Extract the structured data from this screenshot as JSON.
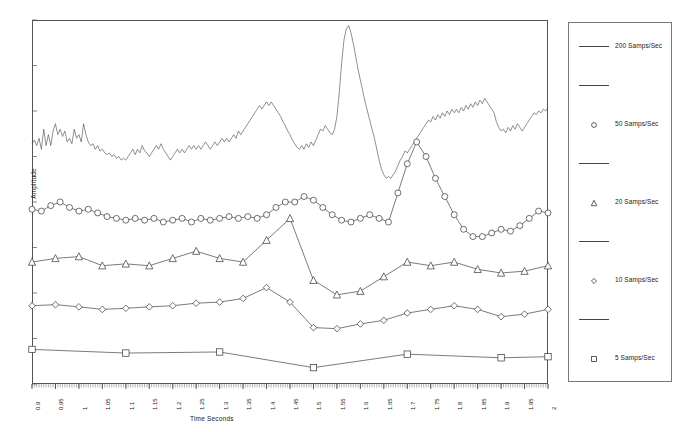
{
  "chart_data": {
    "type": "line",
    "title": "",
    "xlabel": "Time Seconds",
    "ylabel": "Amplitude",
    "xlim": [
      0.9,
      2.0
    ],
    "xtick_step": 0.05,
    "grid": false,
    "legend_position": "right-outside",
    "note": "Five acquisitions of the same transient waveform at different sampling rates, drawn with vertical offsets so the traces do not overlap. Y axis is uncalibrated amplitude (no numeric tick labels).",
    "xticklabels": [
      "0.9",
      "0.95",
      "1",
      "1.05",
      "1.1",
      "1.15",
      "1.2",
      "1.25",
      "1.3",
      "1.35",
      "1.4",
      "1.45",
      "1.5",
      "1.55",
      "1.6",
      "1.65",
      "1.7",
      "1.75",
      "1.8",
      "1.85",
      "1.9",
      "1.95",
      "2"
    ],
    "series": [
      {
        "name": "200 Samps/Sec",
        "marker": "none",
        "color": "#444444",
        "x": [
          0.9,
          0.905,
          0.91,
          0.915,
          0.92,
          0.925,
          0.93,
          0.935,
          0.94,
          0.945,
          0.95,
          0.955,
          0.96,
          0.965,
          0.97,
          0.975,
          0.98,
          0.985,
          0.99,
          0.995,
          1.0,
          1.005,
          1.01,
          1.015,
          1.02,
          1.025,
          1.03,
          1.035,
          1.04,
          1.045,
          1.05,
          1.055,
          1.06,
          1.065,
          1.07,
          1.075,
          1.08,
          1.085,
          1.09,
          1.095,
          1.1,
          1.105,
          1.11,
          1.115,
          1.12,
          1.125,
          1.13,
          1.135,
          1.14,
          1.145,
          1.15,
          1.155,
          1.16,
          1.165,
          1.17,
          1.175,
          1.18,
          1.185,
          1.19,
          1.195,
          1.2,
          1.205,
          1.21,
          1.215,
          1.22,
          1.225,
          1.23,
          1.235,
          1.24,
          1.245,
          1.25,
          1.255,
          1.26,
          1.265,
          1.27,
          1.275,
          1.28,
          1.285,
          1.29,
          1.295,
          1.3,
          1.305,
          1.31,
          1.315,
          1.32,
          1.325,
          1.33,
          1.335,
          1.34,
          1.345,
          1.35,
          1.355,
          1.36,
          1.365,
          1.37,
          1.375,
          1.38,
          1.385,
          1.39,
          1.395,
          1.4,
          1.405,
          1.41,
          1.415,
          1.42,
          1.425,
          1.43,
          1.435,
          1.44,
          1.445,
          1.45,
          1.455,
          1.46,
          1.465,
          1.47,
          1.475,
          1.48,
          1.485,
          1.49,
          1.495,
          1.5,
          1.505,
          1.51,
          1.515,
          1.52,
          1.525,
          1.53,
          1.535,
          1.54,
          1.545,
          1.55,
          1.555,
          1.56,
          1.565,
          1.57,
          1.575,
          1.58,
          1.585,
          1.59,
          1.595,
          1.6,
          1.605,
          1.61,
          1.615,
          1.62,
          1.625,
          1.63,
          1.635,
          1.64,
          1.645,
          1.65,
          1.655,
          1.66,
          1.665,
          1.67,
          1.675,
          1.68,
          1.685,
          1.69,
          1.695,
          1.7,
          1.705,
          1.71,
          1.715,
          1.72,
          1.725,
          1.73,
          1.735,
          1.74,
          1.745,
          1.75,
          1.755,
          1.76,
          1.765,
          1.77,
          1.775,
          1.78,
          1.785,
          1.79,
          1.795,
          1.8,
          1.805,
          1.81,
          1.815,
          1.82,
          1.825,
          1.83,
          1.835,
          1.84,
          1.845,
          1.85,
          1.855,
          1.86,
          1.865,
          1.87,
          1.875,
          1.88,
          1.885,
          1.89,
          1.895,
          1.9,
          1.905,
          1.91,
          1.915,
          1.92,
          1.925,
          1.93,
          1.935,
          1.94,
          1.945,
          1.95,
          1.955,
          1.96,
          1.965,
          1.97,
          1.975,
          1.98,
          1.985,
          1.99,
          1.995,
          2.0
        ],
        "y": [
          0.66,
          0.67,
          0.655,
          0.675,
          0.645,
          0.7,
          0.655,
          0.685,
          0.655,
          0.695,
          0.715,
          0.685,
          0.7,
          0.68,
          0.695,
          0.665,
          0.675,
          0.66,
          0.7,
          0.675,
          0.685,
          0.665,
          0.715,
          0.685,
          0.665,
          0.655,
          0.66,
          0.645,
          0.655,
          0.64,
          0.645,
          0.635,
          0.63,
          0.635,
          0.625,
          0.63,
          0.62,
          0.625,
          0.615,
          0.62,
          0.615,
          0.625,
          0.635,
          0.645,
          0.63,
          0.645,
          0.635,
          0.655,
          0.64,
          0.635,
          0.625,
          0.635,
          0.645,
          0.655,
          0.645,
          0.66,
          0.645,
          0.635,
          0.625,
          0.615,
          0.625,
          0.635,
          0.645,
          0.635,
          0.645,
          0.635,
          0.645,
          0.655,
          0.645,
          0.655,
          0.645,
          0.655,
          0.645,
          0.655,
          0.665,
          0.655,
          0.645,
          0.655,
          0.665,
          0.655,
          0.665,
          0.675,
          0.665,
          0.675,
          0.665,
          0.675,
          0.685,
          0.675,
          0.695,
          0.685,
          0.695,
          0.705,
          0.715,
          0.725,
          0.735,
          0.745,
          0.755,
          0.765,
          0.755,
          0.765,
          0.775,
          0.765,
          0.775,
          0.765,
          0.755,
          0.745,
          0.735,
          0.72,
          0.71,
          0.695,
          0.685,
          0.67,
          0.66,
          0.65,
          0.645,
          0.655,
          0.645,
          0.66,
          0.65,
          0.665,
          0.655,
          0.67,
          0.685,
          0.7,
          0.695,
          0.71,
          0.7,
          0.69,
          0.685,
          0.7,
          0.735,
          0.8,
          0.88,
          0.945,
          0.975,
          0.985,
          0.965,
          0.935,
          0.9,
          0.865,
          0.835,
          0.805,
          0.775,
          0.75,
          0.725,
          0.7,
          0.675,
          0.645,
          0.615,
          0.59,
          0.575,
          0.565,
          0.57,
          0.565,
          0.575,
          0.585,
          0.6,
          0.615,
          0.625,
          0.64,
          0.635,
          0.645,
          0.655,
          0.665,
          0.675,
          0.685,
          0.695,
          0.705,
          0.715,
          0.725,
          0.72,
          0.735,
          0.725,
          0.74,
          0.73,
          0.745,
          0.735,
          0.75,
          0.74,
          0.755,
          0.745,
          0.755,
          0.745,
          0.76,
          0.75,
          0.765,
          0.755,
          0.77,
          0.76,
          0.775,
          0.765,
          0.78,
          0.77,
          0.785,
          0.775,
          0.765,
          0.755,
          0.745,
          0.72,
          0.705,
          0.695,
          0.7,
          0.69,
          0.705,
          0.695,
          0.71,
          0.7,
          0.715,
          0.705,
          0.695,
          0.705,
          0.715,
          0.725,
          0.735,
          0.745,
          0.74,
          0.75,
          0.745,
          0.755,
          0.75,
          0.76
        ]
      },
      {
        "name": "50 Samps/Sec",
        "marker": "circle",
        "color": "#333333",
        "x": [
          0.9,
          0.92,
          0.94,
          0.96,
          0.98,
          1.0,
          1.02,
          1.04,
          1.06,
          1.08,
          1.1,
          1.12,
          1.14,
          1.16,
          1.18,
          1.2,
          1.22,
          1.24,
          1.26,
          1.28,
          1.3,
          1.32,
          1.34,
          1.36,
          1.38,
          1.4,
          1.42,
          1.44,
          1.46,
          1.48,
          1.5,
          1.52,
          1.54,
          1.56,
          1.58,
          1.6,
          1.62,
          1.64,
          1.66,
          1.68,
          1.7,
          1.72,
          1.74,
          1.76,
          1.78,
          1.8,
          1.82,
          1.84,
          1.86,
          1.88,
          1.9,
          1.92,
          1.94,
          1.96,
          1.98,
          2.0
        ],
        "y": [
          0.48,
          0.475,
          0.49,
          0.5,
          0.485,
          0.475,
          0.48,
          0.47,
          0.46,
          0.455,
          0.45,
          0.455,
          0.45,
          0.455,
          0.445,
          0.45,
          0.455,
          0.445,
          0.455,
          0.45,
          0.455,
          0.46,
          0.455,
          0.46,
          0.455,
          0.465,
          0.485,
          0.5,
          0.5,
          0.515,
          0.505,
          0.485,
          0.465,
          0.45,
          0.445,
          0.455,
          0.465,
          0.455,
          0.445,
          0.525,
          0.605,
          0.665,
          0.625,
          0.565,
          0.515,
          0.465,
          0.425,
          0.405,
          0.405,
          0.415,
          0.425,
          0.42,
          0.435,
          0.455,
          0.475,
          0.47
        ]
      },
      {
        "name": "20 Samps/Sec",
        "marker": "triangle",
        "color": "#333333",
        "x": [
          0.9,
          0.95,
          1.0,
          1.05,
          1.1,
          1.15,
          1.2,
          1.25,
          1.3,
          1.35,
          1.4,
          1.45,
          1.5,
          1.55,
          1.6,
          1.65,
          1.7,
          1.75,
          1.8,
          1.85,
          1.9,
          1.95,
          2.0
        ],
        "y": [
          0.335,
          0.345,
          0.35,
          0.325,
          0.33,
          0.325,
          0.345,
          0.365,
          0.345,
          0.335,
          0.395,
          0.455,
          0.285,
          0.245,
          0.255,
          0.295,
          0.335,
          0.325,
          0.335,
          0.315,
          0.305,
          0.31,
          0.325
        ]
      },
      {
        "name": "10 Samps/Sec",
        "marker": "diamond",
        "color": "#333333",
        "x": [
          0.9,
          0.95,
          1.0,
          1.05,
          1.1,
          1.15,
          1.2,
          1.25,
          1.3,
          1.35,
          1.4,
          1.45,
          1.5,
          1.55,
          1.6,
          1.65,
          1.7,
          1.75,
          1.8,
          1.85,
          1.9,
          1.95,
          2.0
        ],
        "y": [
          0.215,
          0.218,
          0.212,
          0.205,
          0.208,
          0.212,
          0.215,
          0.222,
          0.225,
          0.235,
          0.265,
          0.225,
          0.155,
          0.152,
          0.165,
          0.175,
          0.195,
          0.205,
          0.215,
          0.205,
          0.185,
          0.192,
          0.205
        ]
      },
      {
        "name": "5 Samps/Sec",
        "marker": "square",
        "color": "#333333",
        "x": [
          0.9,
          1.1,
          1.3,
          1.5,
          1.7,
          1.9,
          2.0
        ],
        "y": [
          0.095,
          0.085,
          0.088,
          0.045,
          0.082,
          0.072,
          0.075
        ]
      }
    ]
  },
  "legend": {
    "rows": [
      {
        "key": "line",
        "label": "200 Samps/Sec"
      },
      {
        "key": "line",
        "label": ""
      },
      {
        "key": "circle",
        "label": "50 Samps/Sec"
      },
      {
        "key": "line",
        "label": ""
      },
      {
        "key": "triangle",
        "label": "20 Samps/Sec"
      },
      {
        "key": "line",
        "label": ""
      },
      {
        "key": "diamond",
        "label": "10 Samps/Sec"
      },
      {
        "key": "line",
        "label": ""
      },
      {
        "key": "square",
        "label": "5 Samps/Sec"
      }
    ]
  },
  "colors": {
    "trace": "#333333",
    "axis": "#555555",
    "legend_border": "#777777",
    "background": "#ffffff"
  }
}
